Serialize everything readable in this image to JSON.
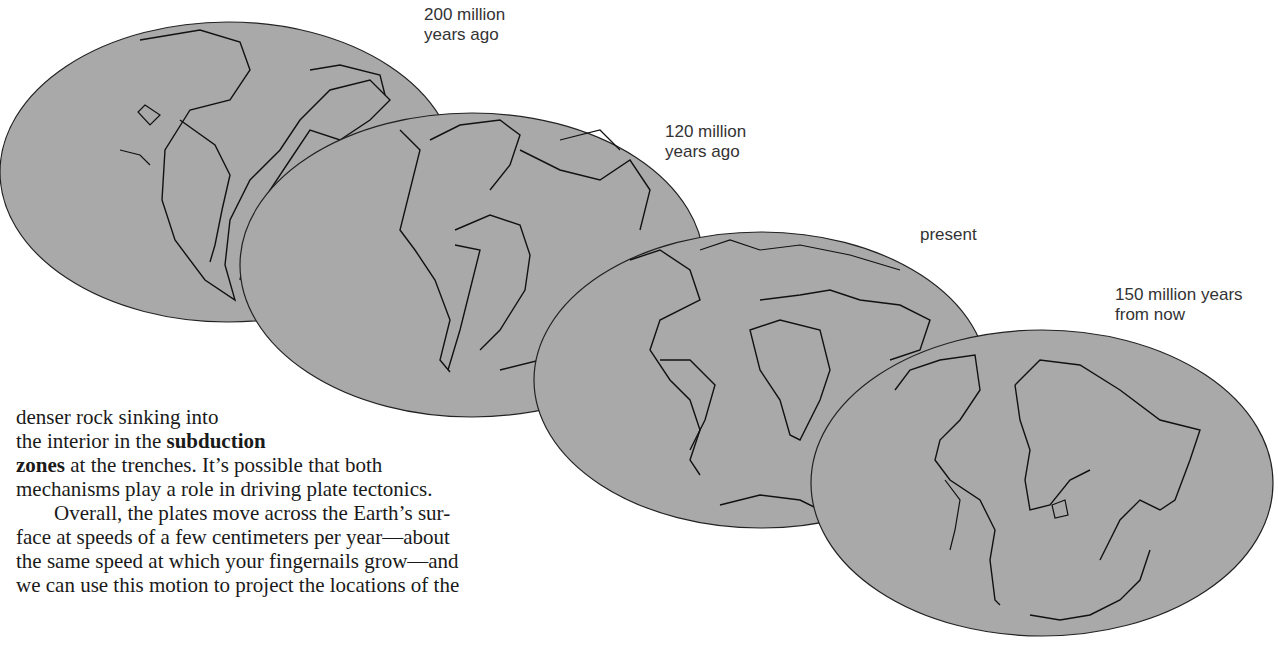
{
  "figure": {
    "globes": [
      {
        "label_line1": "200 million",
        "label_line2": "years ago"
      },
      {
        "label_line1": "120 million",
        "label_line2": "years ago"
      },
      {
        "label_line1": "present",
        "label_line2": ""
      },
      {
        "label_line1": "150 million years",
        "label_line2": "from now"
      }
    ],
    "globe_fill": "#a9a9a9",
    "outline_color": "#222222"
  },
  "text": {
    "line1": "denser rock sinking into",
    "line2_pre": "the interior in the ",
    "line2_bold": "subduction",
    "line3_bold": "zones",
    "line3_post": " at the trenches. It’s possible that both",
    "line4": "mechanisms play a role in driving plate tectonics.",
    "line5": "Overall, the plates move across the Earth’s sur-",
    "line6": "face at speeds of a few centimeters per year—about",
    "line7": "the same speed at which your fingernails grow—and",
    "line8": "we can use this motion to project the locations of the"
  }
}
